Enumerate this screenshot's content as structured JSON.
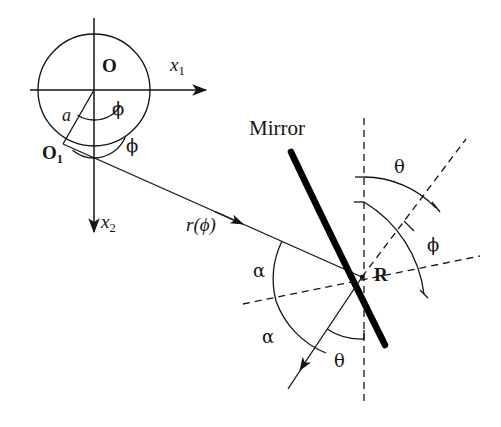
{
  "figure": {
    "background_color": "#ffffff",
    "stroke_color": "#151515",
    "mirror_color": "#000000",
    "labels": {
      "origin": "O",
      "origin_sub1_main": "O",
      "origin_sub1_index": "1",
      "axis_x1_main": "x",
      "axis_x1_index": "1",
      "axis_x2_main": "x",
      "axis_x2_index": "2",
      "radius_a": "a",
      "phi_upper": "ϕ",
      "phi_lower": "ϕ",
      "ray_label": "r(ϕ)",
      "mirror": "Mirror",
      "reflection_point": "R",
      "theta_upper": "θ",
      "phi_right": "ϕ",
      "alpha_upper": "α",
      "alpha_lower": "α",
      "theta_lower": "θ"
    },
    "geometry": {
      "circle_center": [
        94,
        90
      ],
      "circle_radius": 56,
      "origin_point": [
        94,
        90
      ],
      "o1_point": [
        63,
        144
      ],
      "radius_a_length": 62,
      "reflection_point_R": [
        362,
        277
      ],
      "x1_axis": {
        "from": [
          30,
          90
        ],
        "to": [
          212,
          90
        ]
      },
      "x2_axis": {
        "from": [
          94,
          18
        ],
        "to": [
          94,
          238
        ]
      },
      "incident_ray": {
        "from": [
          63,
          144
        ],
        "to": [
          362,
          277
        ]
      },
      "reflected_ray": {
        "from": [
          362,
          277
        ],
        "to": [
          296,
          376
        ]
      },
      "mirror_curve": {
        "start": [
          291,
          152
        ],
        "control": [
          330,
          232
        ],
        "end": [
          385,
          345
        ]
      },
      "normal_dashed": {
        "from": [
          362,
          277
        ],
        "to": [
          464,
          141
        ]
      },
      "tangent_dashed": {
        "from": [
          245,
          303
        ],
        "to": [
          480,
          255
        ]
      },
      "vertical_dashed": {
        "from": [
          364,
          120
        ],
        "to": [
          364,
          404
        ]
      }
    },
    "angle_arcs": [
      {
        "name": "phi-upper-arc",
        "center": [
          94,
          90
        ],
        "radius": 30
      },
      {
        "name": "phi-lower-arc",
        "center": [
          94,
          124
        ],
        "radius": 30
      },
      {
        "name": "theta-upper-arc",
        "center": [
          362,
          277
        ],
        "radius": 100
      },
      {
        "name": "phi-right-arc",
        "center": [
          362,
          277
        ],
        "radius": 125
      },
      {
        "name": "alpha-upper-arc",
        "center": [
          362,
          277
        ],
        "radius": 88
      },
      {
        "name": "alpha-lower-arc",
        "center": [
          362,
          277
        ],
        "radius": 88
      },
      {
        "name": "theta-lower-arc",
        "center": [
          362,
          277
        ],
        "radius": 62
      }
    ]
  }
}
